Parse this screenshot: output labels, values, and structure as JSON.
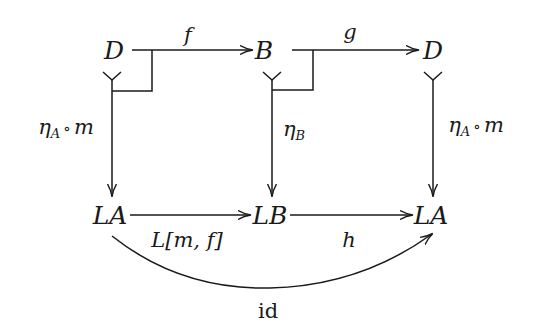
{
  "diagram": {
    "type": "commutative-diagram",
    "stroke_color": "#1a1a1a",
    "nodes": {
      "top_left": "D",
      "top_middle": "B",
      "top_right": "D",
      "bottom_left": "LA",
      "bottom_middle": "LB",
      "bottom_right": "LA"
    },
    "edges": {
      "f": {
        "label": "f",
        "from": "D",
        "to": "B",
        "style": "arrow"
      },
      "g": {
        "label": "g",
        "from": "B",
        "to": "D",
        "style": "arrow"
      },
      "left_vertical": {
        "label_main": "η",
        "label_sub": "A",
        "label_op": "∘",
        "label_tail": "m",
        "from": "D",
        "to": "LA",
        "style": "mono-tail-arrow"
      },
      "middle_vertical": {
        "label_main": "η",
        "label_sub": "B",
        "from": "B",
        "to": "LB",
        "style": "mono-tail-arrow"
      },
      "right_vertical": {
        "label_main": "η",
        "label_sub": "A",
        "label_op": "∘",
        "label_tail": "m",
        "from": "D",
        "to": "LA",
        "style": "mono-tail-arrow"
      },
      "L_m_f": {
        "label": "L[m, f]",
        "from": "LA",
        "to": "LB",
        "style": "arrow"
      },
      "h": {
        "label": "h",
        "from": "LB",
        "to": "LA",
        "style": "arrow"
      },
      "id": {
        "label": "id",
        "from": "LA",
        "to": "LA",
        "style": "curved-arrow"
      }
    },
    "pullback_corners": [
      "left-square",
      "middle-square"
    ]
  }
}
